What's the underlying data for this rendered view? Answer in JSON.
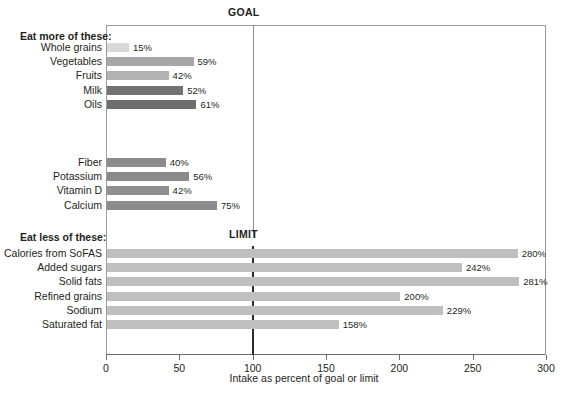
{
  "chart_data": {
    "type": "bar",
    "orientation": "horizontal",
    "title": "",
    "xlabel": "Intake as percent of goal or limit",
    "ylabel": "",
    "xlim": [
      0,
      300
    ],
    "xticks": [
      0,
      50,
      100,
      150,
      200,
      250,
      300
    ],
    "xtick_labels": [
      "0",
      "50",
      "100",
      "150",
      "200",
      "250",
      "300"
    ],
    "grid": false,
    "legend": "none",
    "reference_lines": [
      {
        "name": "GOAL",
        "value": 100,
        "label": "GOAL",
        "color": "#8d8d8d"
      },
      {
        "name": "LIMIT",
        "value": 100,
        "label": "LIMIT",
        "color": "#2b2b2b"
      }
    ],
    "groups": [
      {
        "heading": "Eat more of these:",
        "categories": [
          "Whole grains",
          "Vegetables",
          "Fruits",
          "Milk",
          "Oils"
        ],
        "values": [
          15,
          59,
          42,
          52,
          61
        ],
        "value_labels": [
          "15%",
          "59%",
          "42%",
          "52%",
          "61%"
        ],
        "colors": [
          "#d9d9d9",
          "#a6a6a6",
          "#b3b3b3",
          "#737373",
          "#6e6e6e"
        ]
      },
      {
        "heading": "",
        "categories": [
          "Fiber",
          "Potassium",
          "Vitamin D",
          "Calcium"
        ],
        "values": [
          40,
          56,
          42,
          75
        ],
        "value_labels": [
          "40%",
          "56%",
          "42%",
          "75%"
        ],
        "colors": [
          "#8c8c8c",
          "#8a8a8a",
          "#909090",
          "#8c8c8c"
        ]
      },
      {
        "heading": "Eat less of these:",
        "categories": [
          "Calories from SoFAS",
          "Added sugars",
          "Solid fats",
          "Refined grains",
          "Sodium",
          "Saturated fat"
        ],
        "values": [
          280,
          242,
          281,
          200,
          229,
          158
        ],
        "value_labels": [
          "280%",
          "242%",
          "281%",
          "200%",
          "229%",
          "158%"
        ],
        "colors": [
          "#bfbfbf",
          "#bfbfbf",
          "#bfbfbf",
          "#bfbfbf",
          "#bfbfbf",
          "#bfbfbf"
        ]
      }
    ]
  },
  "axis": {
    "x_title": "Intake as percent of goal or limit"
  },
  "colors": {
    "frame": "#9a9a9a",
    "axis": "#6d6d6d",
    "text": "#231f20",
    "goal_line": "#8d8d8d",
    "limit_line": "#2b2b2b"
  }
}
